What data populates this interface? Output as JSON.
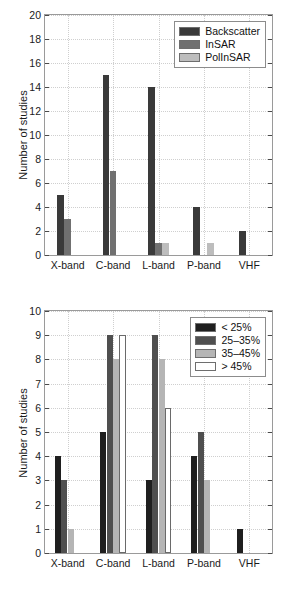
{
  "chart_data": [
    {
      "id": "top",
      "type": "bar",
      "title": "",
      "xlabel": "",
      "ylabel": "Number of studies",
      "categories": [
        "X-band",
        "C-band",
        "L-band",
        "P-band",
        "VHF"
      ],
      "ylim": [
        0,
        20
      ],
      "yticks": [
        0,
        2,
        4,
        6,
        8,
        10,
        12,
        14,
        16,
        18,
        20
      ],
      "ytick_labels": [
        "0",
        "2",
        "4",
        "6",
        "8",
        "10",
        "12",
        "14",
        "16",
        "18",
        "20"
      ],
      "grid": true,
      "legend_position": "upper right",
      "series": [
        {
          "name": "Backscatter",
          "color": "#3a3a3a",
          "values": [
            5,
            15,
            14,
            4,
            2
          ]
        },
        {
          "name": "InSAR",
          "color": "#707070",
          "values": [
            3,
            7,
            1,
            0,
            0
          ]
        },
        {
          "name": "PolInSAR",
          "color": "#bdbdbd",
          "values": [
            0,
            0,
            1,
            1,
            0
          ]
        }
      ]
    },
    {
      "id": "bottom",
      "type": "bar",
      "title": "",
      "xlabel": "",
      "ylabel": "Number of studies",
      "categories": [
        "X-band",
        "C-band",
        "L-band",
        "P-band",
        "VHF"
      ],
      "ylim": [
        0,
        10
      ],
      "yticks": [
        0,
        1,
        2,
        3,
        4,
        5,
        6,
        7,
        8,
        9,
        10
      ],
      "ytick_labels": [
        "0",
        "1",
        "2",
        "3",
        "4",
        "5",
        "6",
        "7",
        "8",
        "9",
        "10"
      ],
      "grid": true,
      "legend_position": "upper right",
      "series": [
        {
          "name": "< 25%",
          "color": "#1f1f1f",
          "values": [
            4,
            5,
            3,
            4,
            1
          ]
        },
        {
          "name": "25–35%",
          "color": "#4f4f4f",
          "values": [
            3,
            9,
            9,
            5,
            0
          ]
        },
        {
          "name": "35–45%",
          "color": "#b5b5b5",
          "values": [
            1,
            8,
            8,
            3,
            0
          ]
        },
        {
          "name": "> 45%",
          "color": "#ffffff",
          "values": [
            0,
            9,
            6,
            0,
            0
          ]
        }
      ]
    }
  ]
}
